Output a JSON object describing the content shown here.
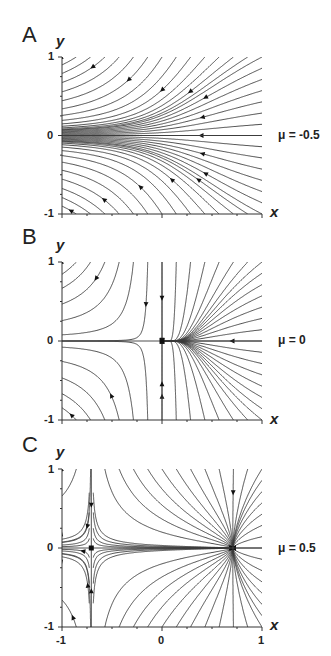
{
  "figure": {
    "panels": [
      {
        "letter": "A",
        "mu_label": "μ = -0.5",
        "y_axis_label": "y",
        "x_axis_label": "x",
        "y_ticks": [
          "1",
          "0",
          "-1"
        ],
        "x_ticks": []
      },
      {
        "letter": "B",
        "mu_label": "μ = 0",
        "y_axis_label": "y",
        "x_axis_label": "x",
        "y_ticks": [
          "1",
          "0",
          "-1"
        ],
        "x_ticks": []
      },
      {
        "letter": "C",
        "mu_label": "μ = 0.5",
        "y_axis_label": "y",
        "x_axis_label": "x",
        "y_ticks": [
          "1",
          "0",
          "-1"
        ],
        "x_ticks": [
          "-1",
          "0",
          "1"
        ]
      }
    ]
  },
  "chart_data": [
    {
      "type": "diagram",
      "title": "Phase portrait A",
      "panel": "A",
      "mu": -0.5,
      "xlabel": "x",
      "ylabel": "y",
      "xlim": [
        -1,
        1
      ],
      "ylim": [
        -1,
        1
      ],
      "fixed_points": [],
      "description": "No fixed points; all trajectories flow leftward and converge toward y = 0"
    },
    {
      "type": "diagram",
      "title": "Phase portrait B",
      "panel": "B",
      "mu": 0,
      "xlabel": "x",
      "ylabel": "y",
      "xlim": [
        -1,
        1
      ],
      "ylim": [
        -1,
        1
      ],
      "fixed_points": [
        {
          "x": 0,
          "y": 0,
          "kind": "saddle-node (half-stable)"
        }
      ],
      "description": "Single saddle-node fixed point at origin; trajectories from the right converge near x≈0.2, flow continues leftward along y = 0"
    },
    {
      "type": "diagram",
      "title": "Phase portrait C",
      "panel": "C",
      "mu": 0.5,
      "xlabel": "x",
      "ylabel": "y",
      "xlim": [
        -1,
        1
      ],
      "ylim": [
        -1,
        1
      ],
      "fixed_points": [
        {
          "x": -0.707,
          "y": 0,
          "kind": "saddle"
        },
        {
          "x": 0.707,
          "y": 0,
          "kind": "stable node"
        }
      ],
      "description": "Saddle at x≈-0.71 and stable node at x≈0.71"
    }
  ],
  "colors": {
    "line": "#3a3a3a",
    "axis": "#333333",
    "background": "#ffffff"
  }
}
